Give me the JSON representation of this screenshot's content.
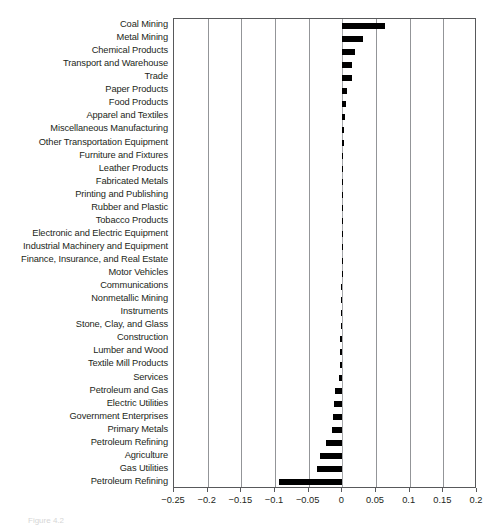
{
  "chart_data": {
    "type": "bar",
    "orientation": "horizontal",
    "title": "",
    "subtitle": "",
    "xlabel": "",
    "ylabel": "",
    "xlim": [
      -0.25,
      0.2
    ],
    "xticks": [
      -0.25,
      -0.2,
      -0.15,
      -0.1,
      -0.05,
      0,
      0.05,
      0.1,
      0.15,
      0.2
    ],
    "xticklabels": [
      "−0.25",
      "−0.2",
      "−0.15",
      "−0.1",
      "−0.05",
      "0",
      "0.05",
      "0.1",
      "0.15",
      "0.2"
    ],
    "grid": true,
    "grid_axis": "x",
    "legend": "none",
    "bar_color": "#000000",
    "categories": [
      "Coal Mining",
      "Metal Mining",
      "Chemical Products",
      "Transport and Warehouse",
      "Trade",
      "Paper Products",
      "Food Products",
      "Apparel and Textiles",
      "Miscellaneous Manufacturing",
      "Other Transportation Equipment",
      "Furniture and Fixtures",
      "Leather Products",
      "Fabricated Metals",
      "Printing and Publishing",
      "Rubber and Plastic",
      "Tobacco Products",
      "Electronic and Electric Equipment",
      "Industrial Machinery and Equipment",
      "Finance, Insurance, and Real Estate",
      "Motor Vehicles",
      "Communications",
      "Nonmetallic Mining",
      "Instruments",
      "Stone, Clay, and Glass",
      "Construction",
      "Lumber and Wood",
      "Textile Mill Products",
      "Services",
      "Petroleum and Gas",
      "Electric Utilities",
      "Government Enterprises",
      "Primary Metals",
      "Petroleum Refining",
      "Agriculture",
      "Gas Utilities",
      "Petroleum Refining"
    ],
    "values": [
      0.064,
      0.031,
      0.019,
      0.015,
      0.015,
      0.007,
      0.006,
      0.004,
      0.003,
      0.002,
      0.001,
      0.001,
      0.0005,
      0.0005,
      0.0,
      0.0,
      -0.0005,
      -0.0005,
      -0.001,
      -0.001,
      -0.0015,
      -0.002,
      -0.002,
      -0.0025,
      -0.003,
      -0.0035,
      -0.004,
      -0.005,
      -0.011,
      -0.012,
      -0.014,
      -0.016,
      -0.025,
      -0.033,
      -0.038,
      -0.094
    ]
  },
  "caption": {
    "text": "Figure 4.2"
  }
}
